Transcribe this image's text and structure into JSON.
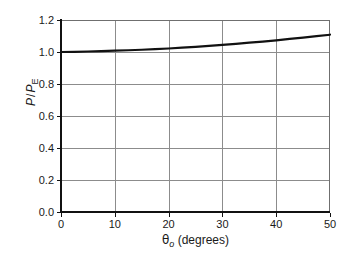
{
  "figure": {
    "background_color": "#ffffff",
    "axis_color": "#111111",
    "grid_color": "#8c8c8c",
    "curve_color": "#111111",
    "caption_partial": ""
  },
  "axes": {
    "y_title_numerator": "P",
    "y_title_slash": "/",
    "y_title_denominator": "P",
    "y_title_denominator_sub": "E",
    "x_title_symbol": "θ",
    "x_title_symbol_sub": "o",
    "x_title_units": " (degrees)"
  },
  "chart_data": {
    "type": "line",
    "title": "",
    "subtitle": "",
    "xlabel": "θo (degrees)",
    "ylabel": "P / PE",
    "xlim": [
      0,
      50
    ],
    "ylim": [
      0.0,
      1.2
    ],
    "xticks": [
      0,
      10,
      20,
      30,
      40,
      50
    ],
    "xtick_labels": [
      "0",
      "10",
      "20",
      "30",
      "40",
      "50"
    ],
    "yticks": [
      0.0,
      0.2,
      0.4,
      0.6,
      0.8,
      1.0,
      1.2
    ],
    "ytick_labels": [
      "0.0",
      "0.2",
      "0.4",
      "0.6",
      "0.8",
      "1.0",
      "1.2"
    ],
    "grid": true,
    "grid_axes": "both",
    "legend": null,
    "legend_position": "none",
    "series": [
      {
        "name": "P/PE vs theta_o",
        "line_width": 2.2,
        "color": "#111111",
        "x": [
          0,
          2.5,
          5,
          7.5,
          10,
          12.5,
          15,
          17.5,
          20,
          22.5,
          25,
          27.5,
          30,
          32.5,
          35,
          37.5,
          40,
          42.5,
          45,
          47.5,
          50
        ],
        "y": [
          1.0,
          1.001,
          1.003,
          1.005,
          1.008,
          1.011,
          1.014,
          1.018,
          1.022,
          1.027,
          1.032,
          1.038,
          1.044,
          1.051,
          1.058,
          1.065,
          1.073,
          1.082,
          1.09,
          1.099,
          1.108
        ]
      }
    ]
  }
}
